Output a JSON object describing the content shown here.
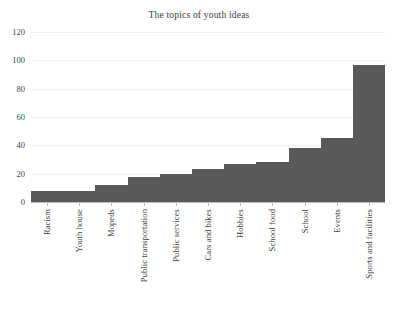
{
  "top_crumb": "",
  "chart_data": {
    "type": "bar",
    "title": "The topics of youth ideas",
    "xlabel": "",
    "ylabel": "",
    "ylim": [
      0,
      120
    ],
    "yticks": [
      0,
      20,
      40,
      60,
      80,
      100,
      120
    ],
    "grid": true,
    "legend": false,
    "bar_color": "#595959",
    "gridline_color": "#efefef",
    "categories": [
      "Racism",
      "Youth house",
      "Mopeds",
      "Public transportation",
      "Public services",
      "Cars and bikes",
      "Hobbies",
      "School food",
      "School",
      "Events",
      "Sports and facilities"
    ],
    "values": [
      8,
      8,
      12,
      18,
      20,
      23,
      27,
      28,
      38,
      45,
      97
    ]
  }
}
